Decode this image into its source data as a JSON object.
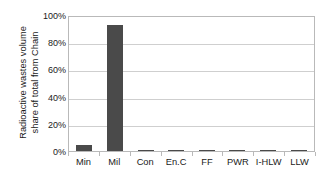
{
  "chart_data": {
    "type": "bar",
    "title": "",
    "subtitle": "",
    "xlabel": "",
    "ylabel_lines": [
      "Radioactive wastes volume",
      "share of total from Chain"
    ],
    "ylabel": "Radioactive wastes volume share of total from Chain",
    "categories": [
      "Min",
      "Mil",
      "Con",
      "En.C",
      "FF",
      "PWR",
      "I-HLW",
      "LLW"
    ],
    "values": [
      4.5,
      93,
      0.6,
      1.1,
      0.1,
      1.1,
      0.05,
      0.05
    ],
    "value_labels": [
      "4.5%",
      "93%",
      "0.6%",
      "1.1%",
      "0.1%",
      "1.1%",
      "0%",
      "0%"
    ],
    "ylim": [
      0,
      100
    ],
    "ytick_values": [
      0,
      20,
      40,
      60,
      80,
      100
    ],
    "ytick_labels": [
      "0%",
      "20%",
      "40%",
      "60%",
      "80%",
      "100%"
    ],
    "grid": true,
    "grid_axis": "y",
    "legend": false,
    "legend_position": "none",
    "series": [
      {
        "name": "Radioactive wastes volume share of total from Chain",
        "values": [
          4.5,
          93,
          0.6,
          1.1,
          0.1,
          1.1,
          0.05,
          0.05
        ]
      }
    ],
    "colors": {
      "bar": "#4a4a4a",
      "gridline": "#cfcfcf",
      "axis": "#b9b9b9",
      "text": "#1a1a1a",
      "background": "#ffffff"
    }
  }
}
